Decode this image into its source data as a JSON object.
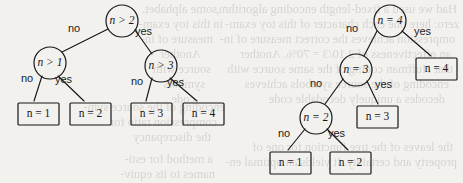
{
  "figure": {
    "type": "diagram",
    "subtype": "decision-tree-pair",
    "background_color": "#f2f1ee",
    "ink_color": "#17161a"
  },
  "trees": [
    {
      "id": "left-tree",
      "name": "balanced-comparison-tree",
      "nodes": [
        {
          "id": "L0",
          "kind": "internal",
          "var": "n",
          "op": ">",
          "value": "2",
          "text": "n > 2",
          "cx": 122,
          "cy": 21,
          "r": 16
        },
        {
          "id": "L1",
          "kind": "internal",
          "var": "n",
          "op": ">",
          "value": "1",
          "text": "n > 1",
          "cx": 50,
          "cy": 63,
          "r": 16
        },
        {
          "id": "L2",
          "kind": "internal",
          "var": "n",
          "op": ">",
          "value": "3",
          "text": "n > 3",
          "cx": 161,
          "cy": 66,
          "r": 16
        },
        {
          "id": "L3",
          "kind": "leaf",
          "var": "n",
          "op": "=",
          "value": "1",
          "text": "n = 1",
          "x": 18,
          "y": 103,
          "w": 41,
          "h": 22
        },
        {
          "id": "L4",
          "kind": "leaf",
          "var": "n",
          "op": "=",
          "value": "2",
          "text": "n = 2",
          "x": 70,
          "y": 103,
          "w": 41,
          "h": 22
        },
        {
          "id": "L5",
          "kind": "leaf",
          "var": "n",
          "op": "=",
          "value": "3",
          "text": "n = 3",
          "x": 131,
          "y": 103,
          "w": 41,
          "h": 22
        },
        {
          "id": "L6",
          "kind": "leaf",
          "var": "n",
          "op": "=",
          "value": "4",
          "text": "n = 4",
          "x": 183,
          "y": 103,
          "w": 41,
          "h": 22
        }
      ],
      "edges": [
        {
          "from": "L0",
          "to": "L1",
          "label": "no",
          "lx": 68,
          "ly": 22,
          "x1": 108,
          "y1": 29,
          "x2": 62,
          "y2": 52
        },
        {
          "from": "L0",
          "to": "L2",
          "label": "yes",
          "lx": 135,
          "ly": 25,
          "x1": 135,
          "y1": 30,
          "x2": 152,
          "y2": 54
        },
        {
          "from": "L1",
          "to": "L3",
          "label": "no",
          "lx": 21,
          "ly": 72,
          "x1": 42,
          "y1": 76,
          "x2": 34,
          "y2": 101
        },
        {
          "from": "L1",
          "to": "L4",
          "label": "yes",
          "lx": 55,
          "ly": 73,
          "x1": 58,
          "y1": 76,
          "x2": 84,
          "y2": 101
        },
        {
          "from": "L2",
          "to": "L5",
          "label": "no",
          "lx": 131,
          "ly": 75,
          "x1": 152,
          "y1": 78,
          "x2": 146,
          "y2": 101
        },
        {
          "from": "L2",
          "to": "L6",
          "label": "yes",
          "lx": 167,
          "ly": 76,
          "x1": 170,
          "y1": 78,
          "x2": 197,
          "y2": 101
        }
      ]
    },
    {
      "id": "right-tree",
      "name": "skewed-equality-tree",
      "nodes": [
        {
          "id": "R0",
          "kind": "internal",
          "var": "n",
          "op": "=",
          "value": "4",
          "text": "n = 4",
          "cx": 390,
          "cy": 21,
          "r": 16
        },
        {
          "id": "R1",
          "kind": "internal",
          "var": "n",
          "op": "=",
          "value": "3",
          "text": "n = 3",
          "cx": 356,
          "cy": 70,
          "r": 16
        },
        {
          "id": "R2",
          "kind": "internal",
          "var": "n",
          "op": "=",
          "value": "2",
          "text": "n = 2",
          "cx": 316,
          "cy": 118,
          "r": 16
        },
        {
          "id": "R3",
          "kind": "leaf",
          "var": "n",
          "op": "=",
          "value": "4",
          "text": "n = 4",
          "x": 416,
          "y": 58,
          "w": 41,
          "h": 22
        },
        {
          "id": "R4",
          "kind": "leaf",
          "var": "n",
          "op": "=",
          "value": "3",
          "text": "n = 3",
          "x": 357,
          "y": 106,
          "w": 41,
          "h": 22
        },
        {
          "id": "R5",
          "kind": "leaf",
          "var": "n",
          "op": "=",
          "value": "1",
          "text": "n = 1",
          "x": 270,
          "y": 152,
          "w": 41,
          "h": 22
        },
        {
          "id": "R6",
          "kind": "leaf",
          "var": "n",
          "op": "=",
          "value": "2",
          "text": "n = 2",
          "x": 330,
          "y": 152,
          "w": 41,
          "h": 22
        }
      ],
      "edges": [
        {
          "from": "R0",
          "to": "R1",
          "label": "no",
          "lx": 346,
          "ly": 22,
          "x1": 377,
          "y1": 31,
          "x2": 364,
          "y2": 56
        },
        {
          "from": "R0",
          "to": "R3",
          "label": "yes",
          "lx": 414,
          "ly": 25,
          "x1": 402,
          "y1": 31,
          "x2": 431,
          "y2": 56
        },
        {
          "from": "R1",
          "to": "R2",
          "label": "no",
          "lx": 310,
          "ly": 77,
          "x1": 343,
          "y1": 79,
          "x2": 325,
          "y2": 104
        },
        {
          "from": "R1",
          "to": "R4",
          "label": "yes",
          "lx": 375,
          "ly": 78,
          "x1": 367,
          "y1": 81,
          "x2": 378,
          "y2": 104
        },
        {
          "from": "R2",
          "to": "R5",
          "label": "no",
          "lx": 278,
          "ly": 127,
          "x1": 305,
          "y1": 129,
          "x2": 288,
          "y2": 150
        },
        {
          "from": "R2",
          "to": "R6",
          "label": "yes",
          "lx": 328,
          "ly": 127,
          "x1": 327,
          "y1": 129,
          "x2": 348,
          "y2": 150
        }
      ]
    }
  ],
  "bleed_text": {
    "note": "faint mirrored show-through text from the reverse side of the scanned page",
    "lines": [
      {
        "text": "Had we used a fixed-length encoding algorithm,",
        "x": 6,
        "y": 2
      },
      {
        "text": "zero: here one each character of this toy exam-",
        "x": 4,
        "y": 17
      },
      {
        "text": "ompression achieves the correct measure of in-",
        "x": 8,
        "y": 32
      },
      {
        "text": "an effectiveness of 2.10/3 = 70%. Another",
        "x": 12,
        "y": 47
      },
      {
        "text": "that Huffman coding of the same source with",
        "x": 10,
        "y": 62
      },
      {
        "text": "encoding of the source symbols achieves",
        "x": 14,
        "y": 77
      },
      {
        "text": "decodes a uniquely decodable code",
        "x": 18,
        "y": 92
      },
      {
        "text": "the leaves of the tree function for one of",
        "x": 10,
        "y": 140
      },
      {
        "text": "property and certainty. It yields an optimal en-",
        "x": 6,
        "y": 155
      },
      {
        "text": "some alphabet.",
        "x": 246,
        "y": 2
      },
      {
        "text": "in this toy exam-",
        "x": 240,
        "y": 17
      },
      {
        "text": "measure of in-",
        "x": 250,
        "y": 32
      },
      {
        "text": "Another",
        "x": 262,
        "y": 47
      },
      {
        "text": "source with",
        "x": 252,
        "y": 62
      },
      {
        "text": "symbols",
        "x": 258,
        "y": 77
      },
      {
        "text": "code",
        "x": 268,
        "y": 92
      },
      {
        "text": "encoding of the source sym-",
        "x": 238,
        "y": 100
      },
      {
        "text": "compression ratio for",
        "x": 246,
        "y": 115
      },
      {
        "text": "the discrepancy",
        "x": 252,
        "y": 130
      },
      {
        "text": "a method for esti-",
        "x": 250,
        "y": 152
      },
      {
        "text": "names to its equiv-",
        "x": 248,
        "y": 167
      }
    ]
  }
}
